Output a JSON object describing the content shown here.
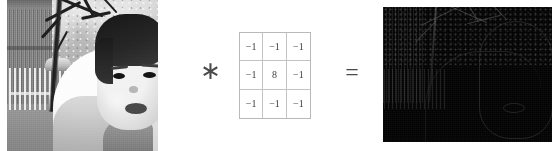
{
  "figure": {
    "type": "convolution-illustration",
    "background_color": "#ffffff"
  },
  "input_image": {
    "label": "input-photograph",
    "subject": "young child in white jacket outdoors with bare tree, picket fence and striped gate",
    "color_mode": "grayscale"
  },
  "operators": {
    "convolution_symbol": "∗",
    "convolution_name": "convolution-operator",
    "equals_symbol": "=",
    "equals_name": "equals-operator"
  },
  "kernel": {
    "name": "laplacian-3x3",
    "rows": 3,
    "cols": 3,
    "cells": [
      "−1",
      "−1",
      "−1",
      "−1",
      "8",
      "−1",
      "−1",
      "−1",
      "−1"
    ],
    "border_color": "#b9b9b9",
    "grid_color": "#c3c3c3",
    "text_color": "#3d3d3d"
  },
  "output_image": {
    "label": "output-edge-image",
    "description": "near-black Laplacian edge response with faint branch, fence and head contours",
    "color_mode": "grayscale",
    "background_color": "#030303"
  }
}
